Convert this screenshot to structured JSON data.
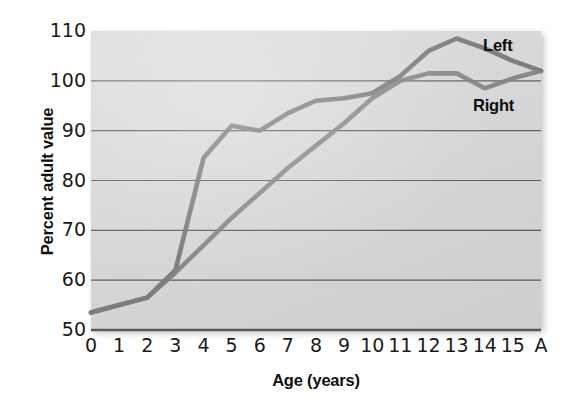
{
  "chart_data": {
    "type": "line",
    "title": "",
    "subtitle": "",
    "xlabel": "Age (years)",
    "ylabel": "Percent adult value",
    "x": [
      "0",
      "1",
      "2",
      "3",
      "4",
      "5",
      "6",
      "7",
      "8",
      "9",
      "10",
      "11",
      "12",
      "13",
      "14",
      "15",
      "A"
    ],
    "categories": [
      "0",
      "1",
      "2",
      "3",
      "4",
      "5",
      "6",
      "7",
      "8",
      "9",
      "10",
      "11",
      "12",
      "13",
      "14",
      "15",
      "A"
    ],
    "xtick_labels": [
      "0",
      "1",
      "2",
      "3",
      "4",
      "5",
      "6",
      "7",
      "8",
      "9",
      "10",
      "11",
      "12",
      "13",
      "14",
      "15",
      "A"
    ],
    "ytick_labels": [
      "110",
      "100",
      "90",
      "80",
      "70",
      "60",
      "50"
    ],
    "yticks": [
      110,
      100,
      90,
      80,
      70,
      60,
      50
    ],
    "ylim": [
      50,
      110
    ],
    "xlim": [
      0,
      16
    ],
    "grid": "horizontal",
    "legend_position": "inline-annotation",
    "series": [
      {
        "name": "Left",
        "color": "#6e6e6e",
        "values": [
          53.5,
          55.0,
          56.5,
          62.0,
          84.5,
          91.0,
          90.0,
          93.5,
          96.0,
          96.5,
          97.5,
          101.0,
          106.0,
          108.5,
          106.5,
          104.0,
          102.0
        ]
      },
      {
        "name": "Right",
        "color": "#7c7c7c",
        "values": [
          53.5,
          55.0,
          56.5,
          61.5,
          67.0,
          72.5,
          77.5,
          82.5,
          87.0,
          91.5,
          96.5,
          100.0,
          101.5,
          101.5,
          98.5,
          100.5,
          102.0
        ]
      }
    ],
    "annotations": [
      {
        "text": "Left",
        "x": "13.8",
        "y": "108"
      },
      {
        "text": "Right",
        "x": "13.4",
        "y": "96"
      }
    ],
    "colors": {
      "plot_background": "#d9d9d9",
      "gridline": "#595959",
      "axis": "#333333",
      "text": "#1a1a1a",
      "series_left": "#6e6e6e",
      "series_right": "#7c7c7c",
      "page_background": "#ffffff"
    }
  }
}
